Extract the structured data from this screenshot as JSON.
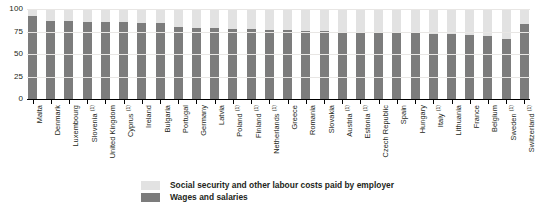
{
  "chart_data": {
    "type": "bar",
    "stacked": true,
    "title": "",
    "subtitle": "",
    "xlabel": "",
    "ylabel": "",
    "ylim": [
      0,
      100
    ],
    "yticks": [
      0,
      25,
      50,
      75,
      100
    ],
    "ytick_labels": [
      "0",
      "25",
      "50",
      "75",
      "100"
    ],
    "grid": true,
    "grid_axis": "y",
    "legend_position": "bottom-center",
    "categories": [
      "Malta",
      "Denmark",
      "Luxembourg",
      "Slovenia (¹)",
      "United Kingdom",
      "Cyprus (¹)",
      "Ireland",
      "Bulgaria",
      "Portugal",
      "Germany",
      "Latvia",
      "Poland (¹)",
      "Finland (¹)",
      "Netherlands (¹)",
      "Greece",
      "Romania",
      "Slovakia",
      "Austria (¹)",
      "Estonia (¹)",
      "Czech Republic",
      "Spain",
      "Hungary",
      "Italy (¹)",
      "Lithuania",
      "France",
      "Belgium",
      "Sweden (¹)",
      "Switzerland (¹)"
    ],
    "category_labels": [
      {
        "name": "Malta",
        "footnote": ""
      },
      {
        "name": "Denmark",
        "footnote": ""
      },
      {
        "name": "Luxembourg",
        "footnote": ""
      },
      {
        "name": "Slovenia",
        "footnote": "1"
      },
      {
        "name": "United Kingdom",
        "footnote": ""
      },
      {
        "name": "Cyprus",
        "footnote": "1"
      },
      {
        "name": "Ireland",
        "footnote": ""
      },
      {
        "name": "Bulgaria",
        "footnote": ""
      },
      {
        "name": "Portugal",
        "footnote": ""
      },
      {
        "name": "Germany",
        "footnote": ""
      },
      {
        "name": "Latvia",
        "footnote": ""
      },
      {
        "name": "Poland",
        "footnote": "1"
      },
      {
        "name": "Finland",
        "footnote": "1"
      },
      {
        "name": "Netherlands",
        "footnote": "1"
      },
      {
        "name": "Greece",
        "footnote": ""
      },
      {
        "name": "Romania",
        "footnote": ""
      },
      {
        "name": "Slovakia",
        "footnote": ""
      },
      {
        "name": "Austria",
        "footnote": "1"
      },
      {
        "name": "Estonia",
        "footnote": "1"
      },
      {
        "name": "Czech Republic",
        "footnote": ""
      },
      {
        "name": "Spain",
        "footnote": ""
      },
      {
        "name": "Hungary",
        "footnote": ""
      },
      {
        "name": "Italy",
        "footnote": "1"
      },
      {
        "name": "Lithuania",
        "footnote": ""
      },
      {
        "name": "France",
        "footnote": ""
      },
      {
        "name": "Belgium",
        "footnote": ""
      },
      {
        "name": "Sweden",
        "footnote": "1"
      },
      {
        "name": "Switzerland",
        "footnote": "1"
      }
    ],
    "series": [
      {
        "name": "Wages and salaries",
        "color": "#7c7c7c",
        "values": [
          92.5,
          87.0,
          86.5,
          86.0,
          86.0,
          85.5,
          84.5,
          84.0,
          79.5,
          79.0,
          78.5,
          78.0,
          77.5,
          77.0,
          76.5,
          76.0,
          75.5,
          75.0,
          74.5,
          74.0,
          73.5,
          73.0,
          72.5,
          72.0,
          71.5,
          70.5,
          67.0,
          83.0
        ]
      },
      {
        "name": "Social security and other labour costs paid by employer",
        "color": "#e2e2e2",
        "values": [
          7.5,
          13.0,
          13.5,
          14.0,
          14.0,
          14.5,
          15.5,
          16.0,
          20.5,
          21.0,
          21.5,
          22.0,
          22.5,
          23.0,
          23.5,
          24.0,
          24.5,
          25.0,
          25.5,
          26.0,
          26.5,
          27.0,
          27.5,
          28.0,
          28.5,
          29.5,
          33.0,
          17.0
        ]
      }
    ]
  },
  "legend": {
    "items": [
      {
        "label": "Social security and other labour costs paid by employer",
        "swatch": "light"
      },
      {
        "label": "Wages and salaries",
        "swatch": "dark"
      }
    ]
  }
}
